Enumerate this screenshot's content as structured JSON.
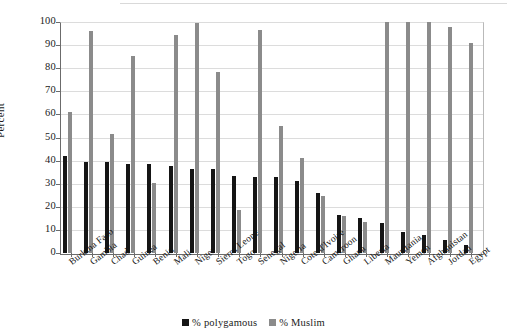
{
  "chart_data": {
    "type": "bar",
    "title": "",
    "xlabel": "",
    "ylabel": "Percent",
    "ylim": [
      0,
      100
    ],
    "yticks": [
      0,
      10,
      20,
      30,
      40,
      50,
      60,
      70,
      80,
      90,
      100
    ],
    "grid": true,
    "legend_position": "bottom",
    "categories": [
      "Burkina Faso",
      "Gambia",
      "Chad",
      "Guinea",
      "Benin",
      "Mali",
      "Niger",
      "Sierra Leone",
      "Togo",
      "Senegal",
      "Nigeria",
      "Cote d'Ivoire",
      "Cameroon",
      "Ghana",
      "Liberia",
      "Mauritania",
      "Yemen",
      "Afghanistan",
      "Jordan",
      "Egypt"
    ],
    "series": [
      {
        "name": "% polygamous",
        "color": "#151515",
        "values": [
          42,
          39.5,
          39.5,
          38.5,
          38.5,
          37.5,
          36.5,
          36.5,
          33.5,
          33,
          33,
          31,
          26,
          16.5,
          15,
          13,
          9,
          8,
          5.5,
          3.5
        ]
      },
      {
        "name": "% Muslim",
        "color": "#8b8b8b",
        "values": [
          61,
          96,
          51.5,
          85.5,
          30.5,
          94.5,
          99.5,
          78.5,
          18.5,
          96.5,
          55,
          41,
          24.5,
          16,
          13.5,
          100,
          100,
          100,
          98,
          91
        ]
      }
    ]
  },
  "legend": {
    "items": [
      {
        "label": "% polygamous",
        "swatch": "black-square-swatch"
      },
      {
        "label": "% Muslim",
        "swatch": "gray-square-swatch"
      }
    ]
  },
  "axes": {
    "y_axis_label": "Percent"
  }
}
